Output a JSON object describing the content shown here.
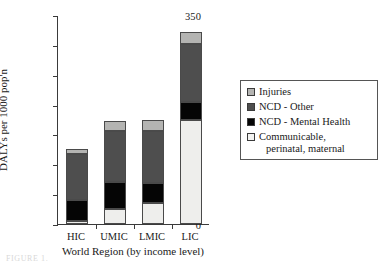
{
  "chart_data": {
    "type": "bar",
    "subtype": "stacked-bar",
    "title": "",
    "xlabel": "World Region (by income level)",
    "ylabel": "DALYs per 1000 pop'n",
    "categories": [
      "HIC",
      "UMIC",
      "LMIC",
      "LIC"
    ],
    "ylim": [
      0,
      350
    ],
    "yticks": [
      0,
      50,
      100,
      150,
      200,
      250,
      300,
      350
    ],
    "ytick_labels": [
      "0",
      "50",
      "100",
      "150",
      "200",
      "250",
      "300",
      "350"
    ],
    "grid": false,
    "legend_position": "right",
    "stack_order_bottom_to_top": [
      "Communicable, perinatal, maternal",
      "NCD - Mental Health",
      "NCD - Other",
      "Injuries"
    ],
    "series": [
      {
        "name": "Communicable, perinatal, maternal",
        "color": "#eeeeec",
        "values": [
          5,
          25,
          35,
          175
        ]
      },
      {
        "name": "NCD - Mental Health",
        "color": "#050505",
        "values": [
          35,
          45,
          33,
          30
        ]
      },
      {
        "name": "NCD - Other",
        "color": "#4e4e4e",
        "values": [
          78,
          85,
          87,
          97
        ]
      },
      {
        "name": "Injuries",
        "color": "#b4b4b2",
        "values": [
          7,
          18,
          20,
          20
        ]
      }
    ],
    "totals": [
      125,
      173,
      175,
      322
    ],
    "legend_entries": [
      {
        "label": "Injuries",
        "color": "#b4b4b2"
      },
      {
        "label": "NCD - Other",
        "color": "#4e4e4e"
      },
      {
        "label": "NCD - Mental Health",
        "color": "#050505"
      },
      {
        "label": "Communicable,",
        "label_line2": "perinatal, maternal",
        "color": "#f3f3f1"
      }
    ]
  },
  "axes": {
    "y_title": "DALYs per 1000 pop'n",
    "x_title": "World Region (by income level)",
    "y_ticks": [
      {
        "value": 350,
        "label": "350"
      },
      {
        "value": 300,
        "label": "300"
      },
      {
        "value": 250,
        "label": "250"
      },
      {
        "value": 200,
        "label": "200"
      },
      {
        "value": 150,
        "label": "150"
      },
      {
        "value": 100,
        "label": "100"
      },
      {
        "value": 50,
        "label": "50"
      },
      {
        "value": 0,
        "label": "0"
      }
    ],
    "x_categories": [
      {
        "label": "HIC"
      },
      {
        "label": "UMIC"
      },
      {
        "label": "LMIC"
      },
      {
        "label": "LIC"
      }
    ]
  },
  "legend": {
    "items": [
      {
        "label": "Injuries",
        "label_line2": "",
        "color": "#b4b4b2",
        "swatch": "legend-swatch-injuries"
      },
      {
        "label": "NCD - Other",
        "label_line2": "",
        "color": "#4e4e4e",
        "swatch": "legend-swatch-ncd-other"
      },
      {
        "label": "NCD - Mental Health",
        "label_line2": "",
        "color": "#050505",
        "swatch": "legend-swatch-ncd-mental-health"
      },
      {
        "label": "Communicable,",
        "label_line2": "perinatal, maternal",
        "color": "#f3f3f1",
        "swatch": "legend-swatch-communicable"
      }
    ]
  },
  "caption": {
    "remnant": "FIGURE 1."
  }
}
